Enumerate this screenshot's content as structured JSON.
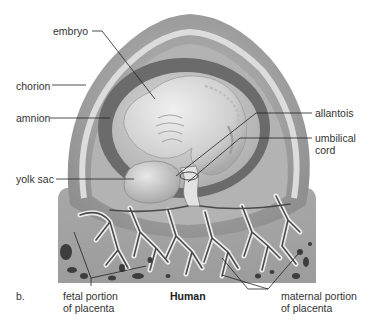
{
  "figure": {
    "panel_label": "b.",
    "title": "Human",
    "labels": {
      "embryo": "embryo",
      "chorion": "chorion",
      "amnion": "amnion",
      "yolk_sac": "yolk sac",
      "allantois": "allantois",
      "umbilical_cord_line1": "umbilical",
      "umbilical_cord_line2": "cord",
      "fetal_placenta_line1": "fetal portion",
      "fetal_placenta_line2": "of placenta",
      "maternal_placenta_line1": "maternal portion",
      "maternal_placenta_line2": "of placenta"
    },
    "colors": {
      "background": "#ffffff",
      "chorion_outer": "#9a9a9a",
      "chorion_light_band": "#d6d6d6",
      "chorion_inner": "#b5b5b5",
      "amnion": "#6e6e6e",
      "amniotic_cavity": "#c8c8c8",
      "embryo": "#d9d9d9",
      "placenta_tissue": "#a3a3a3",
      "villi_outline": "#e6e6e6",
      "vessel": "#4a4a4a",
      "blood_pool": "#3a3a3a",
      "leader_line": "#222222",
      "text": "#333333"
    }
  }
}
